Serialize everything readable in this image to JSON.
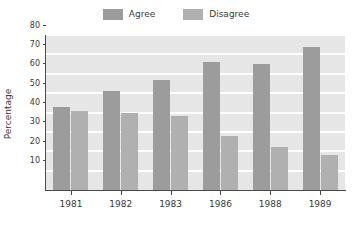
{
  "chart_data": {
    "type": "bar",
    "title": "",
    "xlabel": "",
    "ylabel": "Percentage",
    "categories": [
      "1981",
      "1982",
      "1983",
      "1986",
      "1988",
      "1989"
    ],
    "series": [
      {
        "name": "Agree",
        "color": "#9c9c9c",
        "values": [
          43,
          51,
          57,
          66,
          65,
          74
        ]
      },
      {
        "name": "Disagree",
        "color": "#b0b0b0",
        "values": [
          41,
          40,
          38,
          28,
          22,
          18
        ]
      }
    ],
    "ylim": [
      0,
      80
    ],
    "yticks": [
      10,
      20,
      30,
      40,
      50,
      60,
      70,
      80
    ],
    "ytick_labels": [
      "10",
      "20",
      "30",
      "40",
      "50",
      "60",
      "70",
      "80"
    ],
    "grid": true,
    "grid_color": "#ffffff",
    "plot_background": "#e6e6e6",
    "axis_color": "#4a4a4a",
    "legend_position": "top-center"
  },
  "legend": {
    "entries": [
      {
        "label": "Agree"
      },
      {
        "label": "Disagree"
      }
    ]
  },
  "axes": {
    "y_title": "Percentage"
  }
}
